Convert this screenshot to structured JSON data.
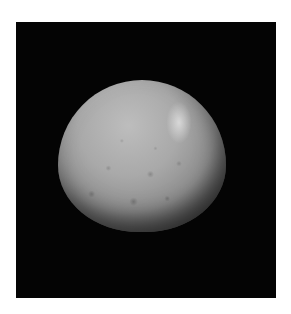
{
  "image": {
    "subject": "cratered dwarf planet / moon",
    "background_color": "#040404",
    "page_color": "#ffffff",
    "surface_color": "#a9a9a9",
    "highlight": "bright spot upper right"
  }
}
